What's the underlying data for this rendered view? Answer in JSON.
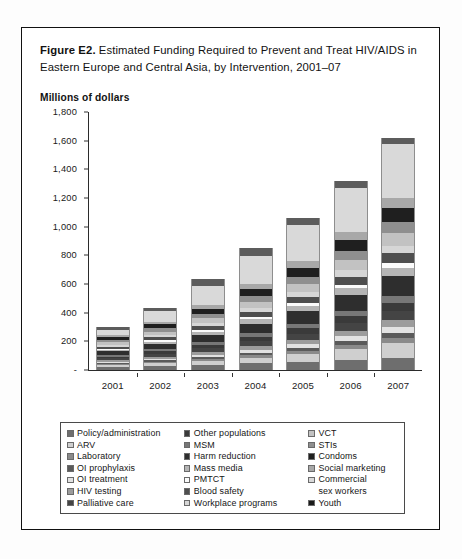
{
  "figure": {
    "number_label": "Figure E2.",
    "title": " Estimated Funding Required to Prevent and Treat HIV/AIDS in Eastern Europe and Central Asia, by Intervention, 2001–07",
    "axis_caption": "Millions of dollars"
  },
  "chart_data": {
    "type": "bar",
    "stacked": true,
    "title": "Estimated Funding Required to Prevent and Treat HIV/AIDS in Eastern Europe and Central Asia, by Intervention, 2001–07",
    "xlabel": "",
    "ylabel": "Millions of dollars",
    "ylim": [
      0,
      1800
    ],
    "yticks": [
      0,
      200,
      400,
      600,
      800,
      1000,
      1200,
      1400,
      1600,
      1800
    ],
    "ytick_labels": [
      "-",
      "200",
      "400",
      "600",
      "800",
      "1,000",
      "1,200",
      "1,400",
      "1,600",
      "1,800"
    ],
    "grid": false,
    "legend_position": "bottom",
    "categories": [
      "2001",
      "2002",
      "2003",
      "2004",
      "2005",
      "2006",
      "2007"
    ],
    "totals": [
      300,
      425,
      575,
      765,
      965,
      1220,
      1520
    ],
    "series": [
      {
        "name": "Policy/administration",
        "color": "#6e6e6e",
        "values": [
          22,
          30,
          38,
          48,
          58,
          70,
          85
        ]
      },
      {
        "name": "ARV",
        "color": "#cfcfcf",
        "values": [
          10,
          16,
          24,
          36,
          52,
          76,
          104
        ]
      },
      {
        "name": "Laboratory",
        "color": "#8a8a8a",
        "values": [
          8,
          11,
          15,
          19,
          24,
          30,
          37
        ]
      },
      {
        "name": "OI prophylaxis",
        "color": "#5a5a5a",
        "values": [
          7,
          10,
          13,
          17,
          21,
          26,
          32
        ]
      },
      {
        "name": "OI treatment",
        "color": "#e2e2e2",
        "values": [
          9,
          12,
          16,
          21,
          26,
          33,
          41
        ]
      },
      {
        "name": "HIV testing",
        "color": "#9c9c9c",
        "values": [
          11,
          15,
          20,
          26,
          32,
          40,
          49
        ]
      },
      {
        "name": "Palliative care",
        "color": "#444444",
        "values": [
          14,
          19,
          25,
          33,
          41,
          51,
          63
        ]
      },
      {
        "name": "Other populations",
        "color": "#3a3a3a",
        "values": [
          13,
          18,
          24,
          31,
          39,
          49,
          60
        ]
      },
      {
        "name": "MSM",
        "color": "#777777",
        "values": [
          10,
          14,
          19,
          25,
          31,
          39,
          48
        ]
      },
      {
        "name": "Harm reduction",
        "color": "#2e2e2e",
        "values": [
          26,
          37,
          50,
          67,
          85,
          108,
          135
        ]
      },
      {
        "name": "Mass media",
        "color": "#b5b5b5",
        "values": [
          12,
          17,
          23,
          30,
          38,
          48,
          59
        ]
      },
      {
        "name": "PMTCT",
        "color": "#fbfbfb",
        "values": [
          7,
          9,
          12,
          16,
          20,
          25,
          31
        ]
      },
      {
        "name": "Blood safety",
        "color": "#4e4e4e",
        "values": [
          15,
          21,
          28,
          37,
          46,
          58,
          72
        ]
      },
      {
        "name": "Workplace programs",
        "color": "#d6d6d6",
        "values": [
          11,
          15,
          20,
          27,
          34,
          43,
          53
        ]
      },
      {
        "name": "VCT",
        "color": "#c2c2c2",
        "values": [
          18,
          25,
          34,
          45,
          56,
          71,
          88
        ]
      },
      {
        "name": "STIs",
        "color": "#8f8f8f",
        "values": [
          16,
          22,
          30,
          39,
          49,
          62,
          77
        ]
      },
      {
        "name": "Condoms",
        "color": "#1f1f1f",
        "values": [
          20,
          28,
          38,
          50,
          63,
          79,
          98
        ]
      },
      {
        "name": "Social marketing",
        "color": "#a8a8a8",
        "values": [
          14,
          20,
          27,
          35,
          44,
          56,
          69
        ]
      },
      {
        "name": "Commercial sex workers",
        "color": "#d9d9d9",
        "values": [
          40,
          72,
          132,
          193,
          253,
          306,
          375
        ]
      },
      {
        "name": "Youth",
        "color": "#5c5c5c",
        "values": [
          17,
          24,
          47,
          60,
          53,
          50,
          44
        ]
      }
    ]
  },
  "legend": {
    "columns": [
      {
        "items": [
          {
            "label": "Policy/administration",
            "color": "#6e6e6e"
          },
          {
            "label": "ARV",
            "color": "#cfcfcf"
          },
          {
            "label": "Laboratory",
            "color": "#8a8a8a"
          },
          {
            "label": "OI prophylaxis",
            "color": "#5a5a5a"
          },
          {
            "label": "OI treatment",
            "color": "#e2e2e2"
          },
          {
            "label": "HIV testing",
            "color": "#9c9c9c"
          },
          {
            "label": "Palliative care",
            "color": "#444444"
          }
        ]
      },
      {
        "items": [
          {
            "label": "Other populations",
            "color": "#3a3a3a"
          },
          {
            "label": "MSM",
            "color": "#777777"
          },
          {
            "label": "Harm reduction",
            "color": "#2e2e2e"
          },
          {
            "label": "Mass media",
            "color": "#b5b5b5"
          },
          {
            "label": "PMTCT",
            "color": "#fbfbfb"
          },
          {
            "label": "Blood safety",
            "color": "#4e4e4e"
          },
          {
            "label": "Workplace programs",
            "color": "#d6d6d6"
          }
        ]
      },
      {
        "items": [
          {
            "label": "VCT",
            "color": "#c2c2c2"
          },
          {
            "label": "STIs",
            "color": "#8f8f8f"
          },
          {
            "label": "Condoms",
            "color": "#1f1f1f"
          },
          {
            "label": "Social marketing",
            "color": "#a8a8a8"
          },
          {
            "label": "Commercial\nsex workers",
            "color": "#d9d9d9"
          },
          {
            "label": "Youth",
            "color": "#1a1a1a"
          }
        ]
      }
    ]
  }
}
